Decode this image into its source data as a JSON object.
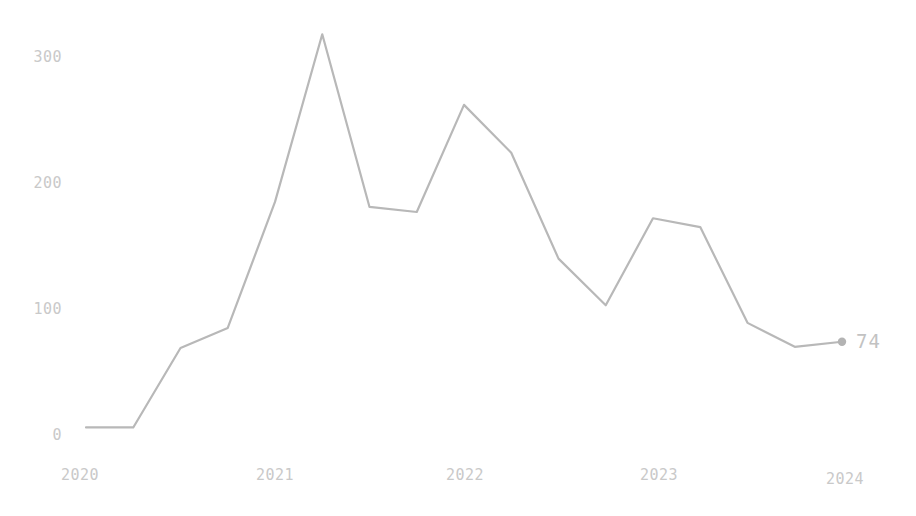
{
  "chart_data": {
    "type": "line",
    "title": "",
    "xlabel": "",
    "ylabel": "",
    "xlim": [
      2020.0,
      2024.0
    ],
    "ylim": [
      0,
      330
    ],
    "grid": false,
    "legend": null,
    "line_color": "#b8b8b8",
    "label_color": "#c9c9c9",
    "background_color": "#ffffff",
    "x_tick_labels": [
      "2020",
      "2021",
      "2022",
      "2023",
      "2024"
    ],
    "x_tick_values": [
      2020,
      2021,
      2022,
      2023,
      2024
    ],
    "y_tick_labels": [
      "0",
      "100",
      "200",
      "300"
    ],
    "y_tick_values": [
      0,
      100,
      200,
      300
    ],
    "end_point_label": "74",
    "end_point_value": 74,
    "x": [
      2020.0,
      2020.25,
      2020.5,
      2020.75,
      2021.0,
      2021.25,
      2021.5,
      2021.75,
      2022.0,
      2022.25,
      2022.5,
      2022.75,
      2023.0,
      2023.25,
      2023.5,
      2023.75,
      2024.0
    ],
    "values": [
      6,
      6,
      69,
      85,
      185,
      318,
      181,
      177,
      262,
      224,
      140,
      103,
      172,
      165,
      89,
      70,
      74
    ],
    "series": [
      {
        "name": "value",
        "values": [
          6,
          6,
          69,
          85,
          185,
          318,
          181,
          177,
          262,
          224,
          140,
          103,
          172,
          165,
          89,
          70,
          74
        ]
      }
    ]
  },
  "axes": {
    "y_ticks": [
      {
        "label": "300"
      },
      {
        "label": "200"
      },
      {
        "label": "100"
      },
      {
        "label": "0"
      }
    ],
    "x_ticks": [
      {
        "label": "2020"
      },
      {
        "label": "2021"
      },
      {
        "label": "2022"
      },
      {
        "label": "2023"
      },
      {
        "label": "2024"
      }
    ]
  },
  "annotations": {
    "last_value_label": "74"
  }
}
